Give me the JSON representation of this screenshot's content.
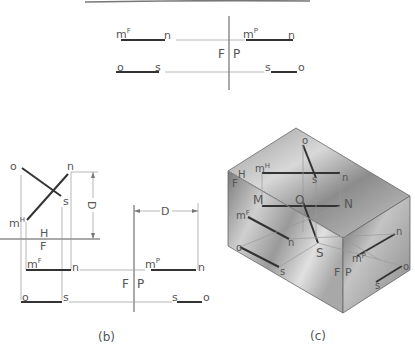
{
  "figure_top": {
    "labels": {
      "mF": "m",
      "mF_sup": "F",
      "n_left": "n",
      "mP": "m",
      "mP_sup": "P",
      "n_right": "n",
      "o_left": "o",
      "s_left": "s",
      "s_right": "s",
      "o_right": "o",
      "F": "F",
      "P": "P"
    }
  },
  "figure_b": {
    "caption": "(b)",
    "labels": {
      "o_top": "o",
      "n_top": "n",
      "s_top": "s",
      "mH": "m",
      "mH_sup": "H",
      "D_vertical": "D",
      "H": "H",
      "F_hf": "F",
      "mF": "m",
      "mF_sup": "F",
      "n_front": "n",
      "mP": "m",
      "mP_sup": "P",
      "n_profile": "n",
      "o_front": "o",
      "s_front": "s",
      "s_profile": "s",
      "o_profile": "o",
      "F": "F",
      "P": "P",
      "D_horizontal": "D"
    }
  },
  "figure_c": {
    "caption": "(c)",
    "labels": {
      "o_top": "o",
      "s_top": "s",
      "n_top": "n",
      "mH": "m",
      "mH_sup": "H",
      "H": "H",
      "F_edge": "F",
      "M": "M",
      "O": "O",
      "N": "N",
      "S": "S",
      "mF": "m",
      "mF_sup": "F",
      "n_front": "n",
      "o_front": "o",
      "s_front": "s",
      "mP": "m",
      "mP_sup": "P",
      "n_side": "n",
      "s_side": "s",
      "o_side": "o",
      "F": "F",
      "P": "P"
    }
  }
}
